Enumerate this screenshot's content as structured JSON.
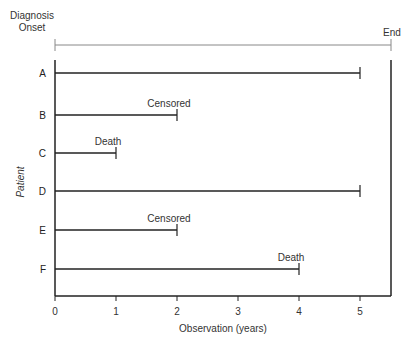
{
  "chart_data": {
    "type": "timeline",
    "title": "",
    "xlabel": "Observation (years)",
    "ylabel": "Patient",
    "xlim": [
      0,
      5.5
    ],
    "x_ticks": [
      "0",
      "1",
      "2",
      "3",
      "4",
      "5"
    ],
    "grid": false,
    "top_span": {
      "start_label": "Diagnosis Onset",
      "start_label_line1": "Diagnosis",
      "start_label_line2": "Onset",
      "end_label": "End",
      "start": 0,
      "end": 5.5
    },
    "categories": [
      "A",
      "B",
      "C",
      "D",
      "E",
      "F"
    ],
    "values": [
      5,
      2,
      1,
      5,
      2,
      4
    ],
    "series": [
      {
        "patient": "A",
        "start": 0,
        "end": 5,
        "annotation": ""
      },
      {
        "patient": "B",
        "start": 0,
        "end": 2,
        "annotation": "Censored"
      },
      {
        "patient": "C",
        "start": 0,
        "end": 1,
        "annotation": "Death"
      },
      {
        "patient": "D",
        "start": 0,
        "end": 5,
        "annotation": ""
      },
      {
        "patient": "E",
        "start": 0,
        "end": 2,
        "annotation": "Censored"
      },
      {
        "patient": "F",
        "start": 0,
        "end": 4,
        "annotation": "Death"
      }
    ],
    "end_of_study": 5.5
  },
  "labels": {
    "diagnosis_line1": "Diagnosis",
    "diagnosis_line2": "Onset",
    "end": "End",
    "xlabel": "Observation (years)",
    "ylabel": "Patient",
    "ticks": [
      "0",
      "1",
      "2",
      "3",
      "4",
      "5"
    ],
    "patients": [
      "A",
      "B",
      "C",
      "D",
      "E",
      "F"
    ],
    "annotations": {
      "B": "Censored",
      "C": "Death",
      "E": "Censored",
      "F": "Death"
    }
  },
  "colors": {
    "line": "#222222",
    "top_span": "#888888",
    "text": "#333333"
  }
}
